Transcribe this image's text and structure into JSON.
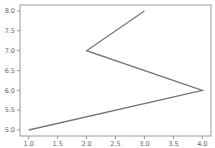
{
  "chart_data": {
    "type": "line",
    "title": "",
    "xlabel": "",
    "ylabel": "",
    "x": [
      1.0,
      4.0,
      2.0,
      3.0
    ],
    "y": [
      5.0,
      6.0,
      7.0,
      8.0
    ],
    "series": [
      {
        "name": "",
        "x": [
          1.0,
          4.0,
          2.0,
          3.0
        ],
        "y": [
          5.0,
          6.0,
          7.0,
          8.0
        ],
        "color": "#777777"
      }
    ],
    "xlim": [
      0.85,
      4.15
    ],
    "ylim": [
      4.85,
      8.15
    ],
    "xticks": [
      "1.0",
      "1.5",
      "2.0",
      "2.5",
      "3.0",
      "3.5",
      "4.0"
    ],
    "yticks": [
      "5.0",
      "5.5",
      "6.0",
      "6.5",
      "7.0",
      "7.5",
      "8.0"
    ],
    "grid": false,
    "legend": null
  },
  "style": {
    "axis_color": "#999999",
    "line_color": "#777777",
    "tick_label_color": "#666666"
  }
}
